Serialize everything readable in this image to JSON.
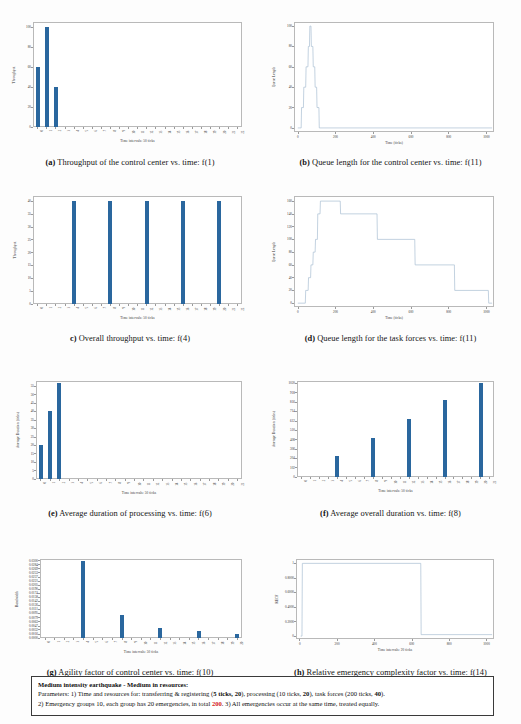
{
  "page": {
    "bar_color": "#2a679e",
    "line_color": "#a9bfd3",
    "axis_color": "#b9b9b9"
  },
  "notice": {
    "title": "Medium intensity earthquake - Medium in resources:",
    "line2_a": "Parameters: 1) Time and resources for: transferring & registering  (",
    "line2_b": "5 ticks, 20",
    "line2_c": "), processing (10 ticks, ",
    "line2_d": "20",
    "line2_e": "), task forces (200 ticks, ",
    "line2_f": "40",
    "line2_g": ").",
    "line3_a": "2) Emergency groups 10, each group has 20 emergencies, in total ",
    "line3_b": "200",
    "line3_c": ". 3) All emergencies occur at the same time, treated equally."
  },
  "charts": [
    {
      "id": "a",
      "caption_label": "(a)",
      "caption_text": "Throughput of the control center vs. time: f(1)",
      "chart_data": {
        "type": "bar",
        "title": "Throughput of the control center vs. time: f(1)",
        "xlabel": "Time intervals: 50 ticks",
        "ylabel": "Throughput",
        "categories": [
          "0",
          "1",
          "2",
          "3",
          "4",
          "5",
          "6",
          "7",
          "8",
          "9",
          "10",
          "11",
          "12",
          "13",
          "14",
          "15",
          "16",
          "17",
          "18",
          "19",
          "20",
          "21",
          "22"
        ],
        "values": [
          60,
          100,
          40,
          0,
          0,
          0,
          0,
          0,
          0,
          0,
          0,
          0,
          0,
          0,
          0,
          0,
          0,
          0,
          0,
          0,
          0,
          0,
          0
        ],
        "yticks": [
          0,
          20,
          40,
          60,
          80,
          100
        ],
        "ylim": [
          0,
          105
        ],
        "grid": false,
        "legend": "none"
      }
    },
    {
      "id": "b",
      "caption_label": "(b)",
      "caption_text": "Queue length for the control center vs. time: f(11)",
      "chart_data": {
        "type": "line",
        "title": "Queue length for the control center vs. time: f(11)",
        "xlabel": "Time (ticks)",
        "ylabel": "Queue Length",
        "xticks": [
          0,
          200,
          400,
          600,
          800,
          1000
        ],
        "yticks": [
          0,
          20,
          40,
          60,
          80,
          100
        ],
        "xlim": [
          -20,
          1040
        ],
        "ylim": [
          -4,
          104
        ],
        "grid": false,
        "legend": "none",
        "x": [
          0,
          18,
          20,
          30,
          32,
          42,
          44,
          54,
          56,
          62,
          64,
          70,
          72,
          80,
          82,
          90,
          92,
          100,
          102,
          112,
          114,
          1030
        ],
        "y": [
          0,
          0,
          20,
          20,
          40,
          40,
          60,
          60,
          80,
          80,
          100,
          100,
          80,
          80,
          60,
          60,
          40,
          40,
          20,
          20,
          0,
          0
        ]
      }
    },
    {
      "id": "c",
      "caption_label": "c)",
      "caption_text": "Overall throughput vs. time: f(4)",
      "chart_data": {
        "type": "bar",
        "title": "Overall throughput vs. time: f(4)",
        "xlabel": "Time intervals: 50 ticks",
        "ylabel": "Throughput",
        "categories": [
          "0",
          "1",
          "2",
          "3",
          "4",
          "5",
          "6",
          "7",
          "8",
          "9",
          "10",
          "11",
          "12",
          "13",
          "14",
          "15",
          "16",
          "17",
          "18",
          "19",
          "20",
          "21",
          "22"
        ],
        "values": [
          0,
          0,
          0,
          0,
          40,
          0,
          0,
          0,
          40,
          0,
          0,
          0,
          40,
          0,
          0,
          0,
          40,
          0,
          0,
          0,
          40,
          0,
          0
        ],
        "yticks": [
          0,
          5,
          10,
          15,
          20,
          25,
          30,
          35,
          40
        ],
        "ylim": [
          0,
          42
        ],
        "grid": false,
        "legend": "none"
      }
    },
    {
      "id": "d",
      "caption_label": "(d)",
      "caption_text": "Queue length for the task forces vs. time: f(11)",
      "chart_data": {
        "type": "line",
        "title": "Queue length for the task forces vs. time: f(11)",
        "xlabel": "Time (ticks)",
        "ylabel": "Queue Length",
        "xticks": [
          0,
          200,
          400,
          600,
          800,
          1000
        ],
        "yticks": [
          0,
          20,
          40,
          60,
          80,
          100,
          120,
          140,
          160
        ],
        "xlim": [
          -20,
          1040
        ],
        "ylim": [
          -6,
          168
        ],
        "grid": false,
        "legend": "none",
        "x": [
          0,
          40,
          42,
          55,
          57,
          68,
          70,
          80,
          82,
          92,
          94,
          104,
          106,
          118,
          120,
          225,
          227,
          420,
          422,
          620,
          622,
          830,
          832,
          1010,
          1012,
          1030
        ],
        "y": [
          0,
          0,
          20,
          20,
          40,
          40,
          60,
          60,
          80,
          80,
          100,
          100,
          140,
          140,
          160,
          160,
          140,
          140,
          100,
          100,
          60,
          60,
          20,
          20,
          0,
          0
        ]
      }
    },
    {
      "id": "e",
      "caption_label": "(e)",
      "caption_text": "Average duration of processing vs. time: f(6)",
      "chart_data": {
        "type": "bar",
        "title": "Average duration of processing vs. time: f(6)",
        "xlabel": "Time intervals: 50 ticks",
        "ylabel": "Average Duration (ticks)",
        "categories": [
          "0",
          "1",
          "2",
          "3",
          "4",
          "5",
          "6",
          "7",
          "8",
          "9",
          "10",
          "11",
          "12",
          "13",
          "14",
          "15",
          "16",
          "17",
          "18",
          "19",
          "20",
          "21"
        ],
        "values": [
          20,
          40,
          57,
          0,
          0,
          0,
          0,
          0,
          0,
          0,
          0,
          0,
          0,
          0,
          0,
          0,
          0,
          0,
          0,
          0,
          0,
          0
        ],
        "yticks": [
          0,
          5,
          10,
          15,
          20,
          25,
          30,
          35,
          40,
          45,
          50,
          55
        ],
        "ylim": [
          0,
          58
        ],
        "grid": false,
        "legend": "none"
      }
    },
    {
      "id": "f",
      "caption_label": "(f)",
      "caption_text": "Average overall duration vs. time: f(8)",
      "chart_data": {
        "type": "bar",
        "title": "Average overall duration vs. time: f(8)",
        "xlabel": "Time intervals: 50 ticks",
        "ylabel": "Average Duration (ticks)",
        "categories": [
          "0",
          "1",
          "2",
          "3",
          "4",
          "5",
          "6",
          "7",
          "8",
          "9",
          "10",
          "11",
          "12",
          "13",
          "14",
          "15",
          "16",
          "17",
          "18",
          "19",
          "20",
          "21"
        ],
        "values": [
          0,
          0,
          0,
          0,
          225,
          0,
          0,
          0,
          428,
          0,
          0,
          0,
          628,
          0,
          0,
          0,
          840,
          0,
          0,
          0,
          1020,
          0
        ],
        "yticks": [
          0,
          102,
          204,
          306,
          408,
          510,
          612,
          714,
          816,
          918,
          1020
        ],
        "ylim": [
          0,
          1045
        ],
        "grid": false,
        "legend": "none"
      }
    },
    {
      "id": "g",
      "caption_label": "(g)",
      "caption_text": "Agility factor of control center vs. time: f(10)",
      "chart_data": {
        "type": "bar",
        "title": "Agility factor of control center vs. time: f(10)",
        "xlabel": "Time intervals: 50 ticks",
        "ylabel": "Bandwidth",
        "categories": [
          "0",
          "1",
          "2",
          "3",
          "4",
          "5",
          "6",
          "7",
          "8",
          "9",
          "10",
          "11",
          "12",
          "13",
          "14",
          "15",
          "16",
          "17",
          "18",
          "19",
          "20"
        ],
        "values": [
          0,
          0,
          0,
          0,
          0.03,
          0,
          0,
          0,
          0.0089,
          0,
          0,
          0,
          0.0039,
          0,
          0,
          0,
          0.0026,
          0,
          0,
          0,
          0.0016
        ],
        "yticks": [
          0.0,
          0.0016,
          0.0032,
          0.0047,
          0.0063,
          0.0079,
          0.0095,
          0.0111,
          0.0126,
          0.0142,
          0.0158,
          0.0174,
          0.019,
          0.0205,
          0.0221,
          0.0237,
          0.0253,
          0.0269,
          0.0284,
          0.03
        ],
        "ytick_labels": [
          "0.0000",
          "0.0016",
          "0.0032",
          "0.0047",
          "0.0063",
          "0.0079",
          "0.0095",
          "0.0111",
          "0.0126",
          "0.0142",
          "0.0158",
          "0.0174",
          "0.0190",
          "0.0205",
          "0.0221",
          "0.0237",
          "0.0253",
          "0.0269",
          "0.0284",
          "0.0300"
        ],
        "ylim": [
          0,
          0.0306
        ],
        "grid": false,
        "legend": "none"
      }
    },
    {
      "id": "h",
      "caption_label": "(h)",
      "caption_text": "Relative emergency complexity factor vs. time: f(14)",
      "chart_data": {
        "type": "line",
        "title": "Relative emergency complexity factor vs. time: f(14)",
        "xlabel": "Time intervals: 20 ticks",
        "ylabel": "RECF",
        "xticks": [
          0,
          200,
          400,
          600,
          800,
          1000
        ],
        "yticks": [
          0.0,
          0.2,
          0.4,
          0.6,
          0.8,
          1.0
        ],
        "xlim": [
          -20,
          1040
        ],
        "ylim": [
          -0.04,
          1.06
        ],
        "grid": false,
        "legend": "none",
        "x": [
          5,
          12,
          14,
          648,
          650,
          1030
        ],
        "y": [
          0,
          0,
          1.0,
          1.0,
          0.02,
          0.02
        ]
      }
    }
  ]
}
